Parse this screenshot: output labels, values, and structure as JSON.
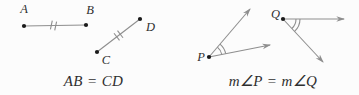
{
  "figure": {
    "background": "#fcfcfc",
    "colors": {
      "line": "#8e8e8e",
      "point": "#1a1a1a",
      "text": "#2f2f2f"
    },
    "segments": {
      "point_a": "A",
      "point_b": "B",
      "point_c": "C",
      "point_d": "D",
      "equation": "AB = CD"
    },
    "angles": {
      "point_p": "P",
      "point_q": "Q",
      "equation": "m∠P = m∠Q"
    }
  }
}
